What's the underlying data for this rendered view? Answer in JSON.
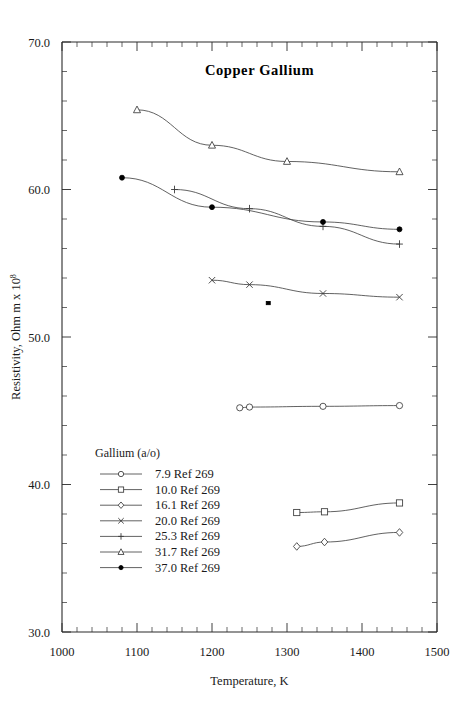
{
  "chart_data": {
    "type": "line",
    "title": "Copper Gallium",
    "xlabel": "Temperature,  K",
    "ylabel": "Resistivity, Ohm m x 10",
    "ylabel_superscript": "8",
    "xlim": [
      1000,
      1500
    ],
    "ylim": [
      30.0,
      70.0
    ],
    "xticks": [
      1000,
      1100,
      1200,
      1300,
      1400,
      1500
    ],
    "xticklabels": [
      "1000",
      "1100",
      "1200",
      "1300",
      "1400",
      "1500"
    ],
    "yticks": [
      30.0,
      40.0,
      50.0,
      60.0,
      70.0
    ],
    "yticklabels": [
      "30.0",
      "40.0",
      "50.0",
      "60.0",
      "70.0"
    ],
    "x_minor_step": 20,
    "y_minor_step": 2,
    "grid": false,
    "legend_position": "lower-left-inside",
    "legend_title": "Gallium (a/o)",
    "series": [
      {
        "name": "7.9 Ref 269",
        "composition": "7.9",
        "reference": "Ref 269",
        "marker": "circle-open",
        "x": [
          1237,
          1250,
          1348,
          1450
        ],
        "y": [
          45.2,
          45.25,
          45.3,
          45.35
        ]
      },
      {
        "name": "10.0 Ref 269",
        "composition": "10.0",
        "reference": "Ref 269",
        "marker": "square-open",
        "x": [
          1313,
          1350,
          1450
        ],
        "y": [
          38.1,
          38.15,
          38.75
        ]
      },
      {
        "name": "16.1 Ref 269",
        "composition": "16.1",
        "reference": "Ref 269",
        "marker": "diamond-open",
        "x": [
          1313,
          1350,
          1450
        ],
        "y": [
          35.8,
          36.1,
          36.75
        ]
      },
      {
        "name": "20.0 Ref 269",
        "composition": "20.0",
        "reference": "Ref 269",
        "marker": "cross-x",
        "x": [
          1200,
          1250,
          1348,
          1450
        ],
        "y": [
          53.85,
          53.55,
          52.95,
          52.7
        ]
      },
      {
        "name": "25.3 Ref 269",
        "composition": "25.3",
        "reference": "Ref 269",
        "marker": "plus",
        "x": [
          1150,
          1250,
          1348,
          1450
        ],
        "y": [
          60.0,
          58.7,
          57.5,
          56.3
        ]
      },
      {
        "name": "31.7 Ref 269",
        "composition": "31.7",
        "reference": "Ref 269",
        "marker": "triangle-open",
        "x": [
          1100,
          1200,
          1300,
          1450
        ],
        "y": [
          65.4,
          63.0,
          61.9,
          61.2
        ]
      },
      {
        "name": "37.0 Ref 269",
        "composition": "37.0",
        "reference": "Ref 269",
        "marker": "circle-filled",
        "x": [
          1080,
          1200,
          1348,
          1450
        ],
        "y": [
          60.8,
          58.8,
          57.8,
          57.3
        ]
      }
    ],
    "annotations": [
      {
        "name": "isolated-point",
        "marker": "square-small-filled",
        "x": 1275,
        "y": 52.3
      }
    ]
  }
}
